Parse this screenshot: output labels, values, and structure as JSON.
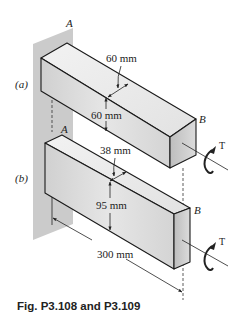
{
  "figure": {
    "caption": "Fig. P3.108 and P3.109",
    "colors": {
      "wall": "#c9c9c9",
      "bar_top": "#e8e8e8",
      "bar_front": "#d6d6d6",
      "bar_end": "#bdbdbd",
      "line": "#1a1a1a"
    },
    "part_a": {
      "label": "(a)",
      "end_left": "A",
      "end_right": "B",
      "width_dim": "60 mm",
      "height_dim": "60 mm",
      "torque": "T"
    },
    "part_b": {
      "label": "(b)",
      "end_left": "A",
      "end_right": "B",
      "width_dim": "38 mm",
      "height_dim": "95 mm",
      "length_dim": "300 mm",
      "torque": "T"
    }
  }
}
